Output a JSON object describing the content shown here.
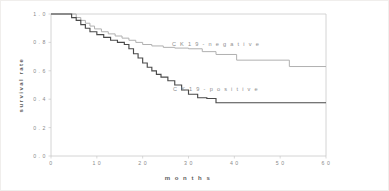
{
  "chart_data": {
    "type": "line",
    "subtype": "kaplan-meier-step",
    "title": "",
    "xlabel": "m o n t h s",
    "ylabel": "survival rate",
    "xlim": [
      0,
      60
    ],
    "ylim": [
      0.0,
      1.0
    ],
    "grid": false,
    "legend_position": "inline-annotation",
    "xticks": [
      "0",
      "1 0",
      "2 0",
      "3 0",
      "4 0",
      "5 0",
      "6 0"
    ],
    "xtick_values": [
      0,
      10,
      20,
      30,
      40,
      50,
      60
    ],
    "yticks": [
      "1 . 0",
      "0 . 8",
      "0 . 6",
      "0 . 4",
      "0 . 2",
      "0 . 0"
    ],
    "ytick_values": [
      1.0,
      0.8,
      0.6,
      0.4,
      0.2,
      0.0
    ],
    "series": [
      {
        "name": "CK 19-negative",
        "label": "C K  1 9 - n e g a t i v e",
        "color": "#b0b0b0",
        "label_x": 36,
        "label_y": 0.775,
        "x": [
          0,
          4.5,
          5.5,
          6.5,
          7.5,
          8.5,
          9.5,
          11,
          12.5,
          14,
          15.5,
          17,
          18.5,
          20,
          22,
          24.5,
          27,
          30,
          33,
          36,
          40.5,
          52,
          60
        ],
        "y": [
          1.0,
          1.0,
          0.975,
          0.955,
          0.935,
          0.915,
          0.895,
          0.875,
          0.86,
          0.845,
          0.83,
          0.815,
          0.8,
          0.785,
          0.775,
          0.765,
          0.76,
          0.755,
          0.735,
          0.715,
          0.675,
          0.63,
          0.63
        ]
      },
      {
        "name": "CK 19-positive",
        "label": "C K  1 9 - p o s i t i v e",
        "color": "#4a4a4a",
        "label_x": 36,
        "label_y": 0.455,
        "x": [
          0,
          3.5,
          4.5,
          5.5,
          6.5,
          7.5,
          8.5,
          10,
          11.5,
          13,
          14.5,
          16,
          17,
          18,
          19,
          20,
          21,
          22,
          23,
          24,
          25.5,
          27,
          28.5,
          30,
          32,
          34,
          36,
          60
        ],
        "y": [
          1.0,
          1.0,
          0.975,
          0.955,
          0.925,
          0.9,
          0.875,
          0.855,
          0.835,
          0.815,
          0.8,
          0.785,
          0.755,
          0.72,
          0.69,
          0.655,
          0.625,
          0.6,
          0.575,
          0.555,
          0.53,
          0.5,
          0.465,
          0.435,
          0.41,
          0.405,
          0.375,
          0.375
        ]
      }
    ]
  }
}
